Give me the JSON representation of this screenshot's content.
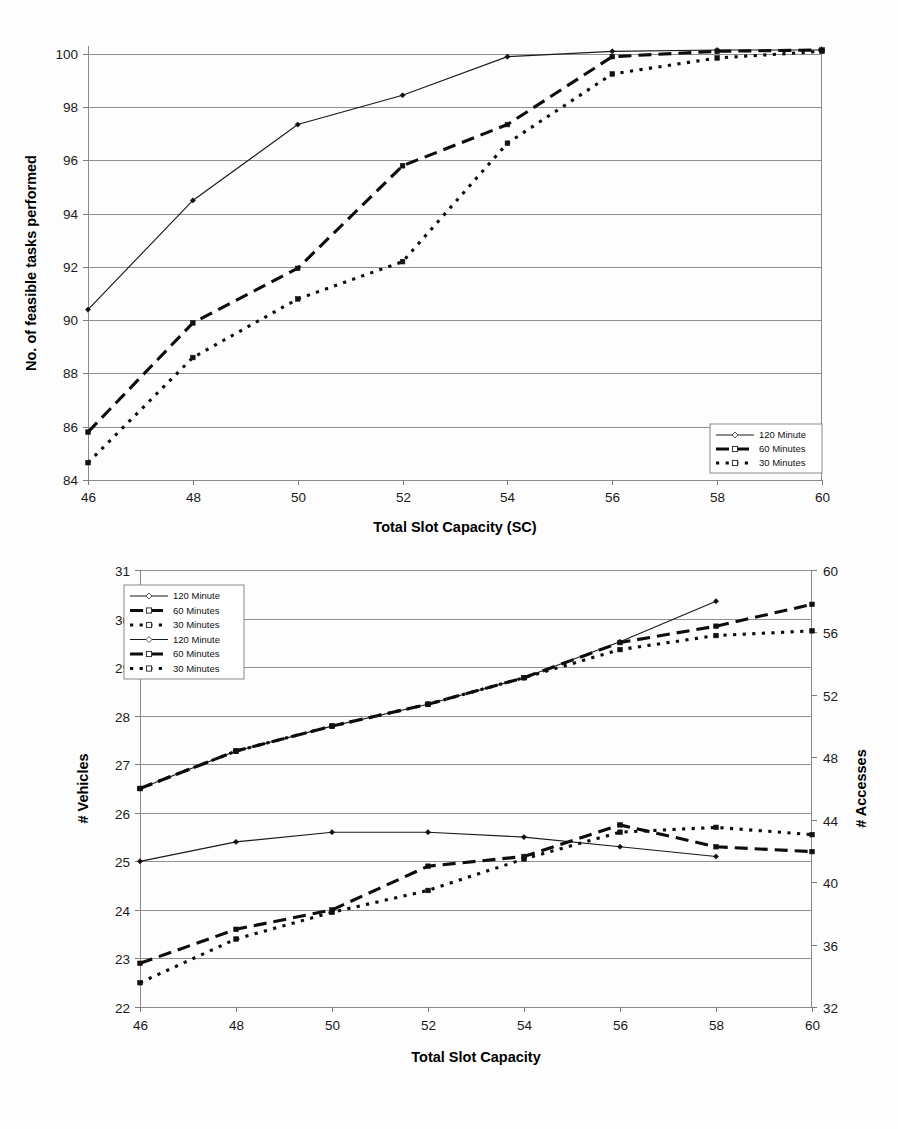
{
  "figures": [
    {
      "id": "figure-1",
      "xlabel": "Total Slot Capacity (SC)",
      "ylabel": "No. of feasible tasks performed",
      "xticks": [
        "46",
        "48",
        "50",
        "52",
        "54",
        "56",
        "58",
        "60"
      ],
      "yticks": [
        "84",
        "86",
        "88",
        "90",
        "92",
        "94",
        "96",
        "98",
        "100"
      ],
      "legend": [
        "120 Minute",
        "60 Minutes",
        "30 Minutes"
      ]
    },
    {
      "id": "figure-2",
      "xlabel": "Total Slot Capacity",
      "ylabel_left": "# Vehicles",
      "ylabel_right": "# Accesses",
      "xticks": [
        "46",
        "48",
        "50",
        "52",
        "54",
        "56",
        "58",
        "60"
      ],
      "yticks_left": [
        "22",
        "23",
        "24",
        "25",
        "26",
        "27",
        "28",
        "29",
        "30",
        "31"
      ],
      "yticks_right": [
        "32",
        "36",
        "40",
        "44",
        "48",
        "52",
        "56",
        "60"
      ],
      "legend": [
        "120 Minute",
        "60 Minutes",
        "30 Minutes",
        "120 Minute",
        "60 Minutes",
        "30 Minutes"
      ]
    }
  ],
  "chart_data": [
    {
      "type": "line",
      "title": "",
      "xlabel": "Total Slot Capacity (SC)",
      "ylabel": "No. of feasible tasks performed",
      "x": [
        46,
        48,
        50,
        52,
        54,
        56,
        58,
        60
      ],
      "xlim": [
        46,
        60
      ],
      "ylim": [
        84,
        100.3
      ],
      "xticks": [
        46,
        48,
        50,
        52,
        54,
        56,
        58,
        60
      ],
      "yticks": [
        84,
        86,
        88,
        90,
        92,
        94,
        96,
        98,
        100
      ],
      "grid": "horizontal",
      "legend_position": "bottom-right",
      "series": [
        {
          "name": "120 Minute",
          "style": "thin-solid",
          "marker": "diamond",
          "values": [
            90.4,
            94.5,
            97.35,
            98.45,
            99.9,
            100.1,
            100.15,
            100.15
          ]
        },
        {
          "name": "60 Minutes",
          "style": "thick-dashed",
          "marker": "square",
          "values": [
            85.8,
            89.9,
            91.95,
            95.8,
            97.35,
            99.9,
            100.1,
            100.15
          ]
        },
        {
          "name": "30 Minutes",
          "style": "thick-dotted",
          "marker": "square",
          "values": [
            84.65,
            88.6,
            90.8,
            92.2,
            96.65,
            99.25,
            99.85,
            100.1
          ]
        }
      ]
    },
    {
      "type": "line",
      "title": "",
      "xlabel": "Total Slot Capacity",
      "ylabel": "# Vehicles",
      "ylabel_secondary": "# Accesses",
      "x": [
        46,
        48,
        50,
        52,
        54,
        56,
        58,
        60
      ],
      "xlim": [
        46,
        60
      ],
      "ylim": [
        22,
        31
      ],
      "ylim_secondary": [
        32,
        60
      ],
      "xticks": [
        46,
        48,
        50,
        52,
        54,
        56,
        58,
        60
      ],
      "yticks": [
        22,
        23,
        24,
        25,
        26,
        27,
        28,
        29,
        30,
        31
      ],
      "yticks_secondary": [
        32,
        36,
        40,
        44,
        48,
        52,
        56,
        60
      ],
      "grid": "horizontal",
      "legend_position": "top-left",
      "series": [
        {
          "name": "120 Minute",
          "axis": "left",
          "group": "vehicles",
          "style": "thin-solid",
          "marker": "diamond",
          "values": [
            25.0,
            25.4,
            25.6,
            25.6,
            25.5,
            25.3,
            25.1,
            null
          ]
        },
        {
          "name": "60 Minutes",
          "axis": "left",
          "group": "vehicles",
          "style": "thick-dashed",
          "marker": "square",
          "values": [
            22.9,
            23.6,
            24.0,
            24.9,
            25.1,
            25.75,
            25.3,
            25.2
          ]
        },
        {
          "name": "30 Minutes",
          "axis": "left",
          "group": "vehicles",
          "style": "thick-dotted",
          "marker": "square",
          "values": [
            22.5,
            23.4,
            23.95,
            24.4,
            25.05,
            25.6,
            25.7,
            25.55
          ]
        },
        {
          "name": "120 Minute",
          "axis": "right",
          "group": "accesses",
          "style": "thin-solid",
          "marker": "diamond",
          "values": [
            46.0,
            48.4,
            50.0,
            51.4,
            53.1,
            55.4,
            58.0,
            null
          ]
        },
        {
          "name": "60 Minutes",
          "axis": "right",
          "group": "accesses",
          "style": "thick-dashed",
          "marker": "square",
          "values": [
            46.0,
            48.4,
            50.0,
            51.4,
            53.1,
            55.35,
            56.4,
            57.8
          ]
        },
        {
          "name": "30 Minutes",
          "axis": "right",
          "group": "accesses",
          "style": "thick-dotted",
          "marker": "square",
          "values": [
            46.0,
            48.4,
            50.0,
            51.4,
            53.1,
            54.9,
            55.8,
            56.1
          ]
        }
      ]
    }
  ]
}
